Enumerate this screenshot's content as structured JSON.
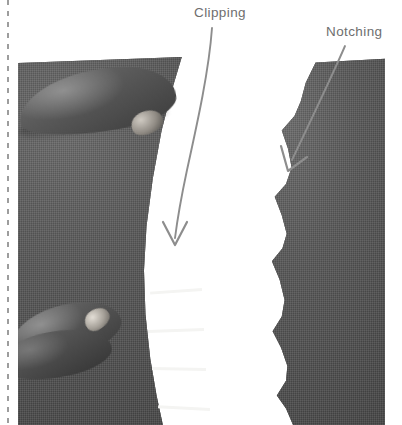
{
  "figure": {
    "caption_labels": [
      {
        "id": "clipping",
        "text": "Clipping"
      },
      {
        "id": "notching",
        "text": "Notching"
      }
    ],
    "annotations": {
      "clipping_label": "Clipping",
      "notching_label": "Notching"
    },
    "icons": {
      "clipping_arrow": "curved-down-arrow-icon",
      "notching_arrow": "diagonal-down-left-arrow-icon",
      "fold_guide": "dashed-vertical-line-icon"
    },
    "colors": {
      "fabric": "#585858",
      "seam_gap": "#ffffff",
      "label_text": "#6e6e6e",
      "arrow": "#8a8a8a",
      "page_background": "#ffffff",
      "fold_line": "#8c8c8c"
    },
    "photo": {
      "subject": "gray fabric curved seam allowance held by two fingers",
      "left_technique": "clipping",
      "right_technique": "notching",
      "clip_slit_count": 4,
      "notch_count": 6
    }
  }
}
